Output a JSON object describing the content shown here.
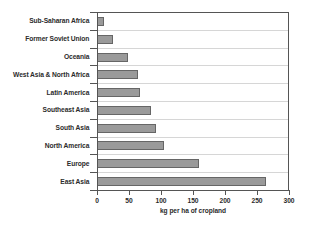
{
  "chart_data": {
    "type": "bar",
    "orientation": "horizontal",
    "title": "",
    "xlabel": "kg per ha of cropland",
    "ylabel": "",
    "xlim": [
      0,
      300
    ],
    "xticks": [
      0,
      50,
      100,
      150,
      200,
      250,
      300
    ],
    "grid": true,
    "legend": false,
    "categories": [
      "Sub-Saharan Africa",
      "Former Soviet Union",
      "Oceania",
      "West Asia & North Africa",
      "Latin America",
      "Southeast Asia",
      "South Asia",
      "North America",
      "Europe",
      "East Asia"
    ],
    "values": [
      11,
      25,
      48,
      65,
      67,
      85,
      92,
      105,
      160,
      265
    ],
    "colors": {
      "bar_fill": "#9a9a9a",
      "bar_border": "#666666",
      "grid": "#d6d6d6",
      "axis": "#555555",
      "text": "#2b2b2b",
      "background": "#ffffff"
    }
  }
}
